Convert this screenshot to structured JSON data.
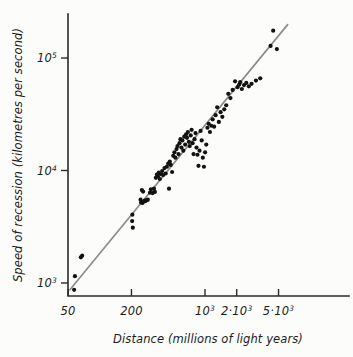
{
  "chart_data": {
    "type": "scatter",
    "title": "",
    "xlabel": "Distance (millions of light years)",
    "ylabel": "Speed of recession (kilometres per second)",
    "xscale": "log",
    "yscale": "log",
    "xlim": [
      45,
      7000
    ],
    "ylim": [
      750,
      250000
    ],
    "grid": false,
    "legend": null,
    "xticks": [
      {
        "value": 50,
        "label": "50",
        "mantissa": "50",
        "exponent": ""
      },
      {
        "value": 200,
        "label": "200",
        "mantissa": "200",
        "exponent": ""
      },
      {
        "value": 1000,
        "label": "10³",
        "mantissa": "10",
        "exponent": "3"
      },
      {
        "value": 2000,
        "label": "2·10³",
        "mantissa": "2·10",
        "exponent": "3"
      },
      {
        "value": 5000,
        "label": "5·10³",
        "mantissa": "5·10",
        "exponent": "3"
      }
    ],
    "yticks": [
      {
        "value": 1000,
        "label": "10³",
        "mantissa": "10",
        "exponent": "3"
      },
      {
        "value": 10000,
        "label": "10⁴",
        "mantissa": "10",
        "exponent": "4"
      },
      {
        "value": 100000,
        "label": "10⁵",
        "mantissa": "10",
        "exponent": "5"
      }
    ],
    "series": [
      {
        "name": "galaxies",
        "marker": "filled-circle",
        "marker_color": "#121212",
        "marker_size": 4.2,
        "points": [
          [
            57,
            870
          ],
          [
            58,
            1150
          ],
          [
            66,
            1690
          ],
          [
            68,
            1750
          ],
          [
            203,
            3550
          ],
          [
            204,
            4050
          ],
          [
            206,
            3100
          ],
          [
            244,
            5500
          ],
          [
            247,
            5200
          ],
          [
            251,
            6700
          ],
          [
            255,
            5150
          ],
          [
            258,
            6500
          ],
          [
            262,
            5300
          ],
          [
            268,
            5400
          ],
          [
            272,
            5350
          ],
          [
            279,
            5450
          ],
          [
            286,
            5500
          ],
          [
            300,
            6350
          ],
          [
            306,
            6800
          ],
          [
            318,
            6300
          ],
          [
            327,
            6900
          ],
          [
            334,
            6450
          ],
          [
            341,
            8600
          ],
          [
            349,
            9200
          ],
          [
            357,
            8900
          ],
          [
            364,
            9600
          ],
          [
            372,
            8400
          ],
          [
            381,
            9300
          ],
          [
            392,
            9900
          ],
          [
            400,
            9100
          ],
          [
            412,
            10500
          ],
          [
            423,
            9400
          ],
          [
            434,
            10800
          ],
          [
            447,
            11500
          ],
          [
            455,
            6900
          ],
          [
            463,
            12000
          ],
          [
            472,
            11200
          ],
          [
            487,
            9700
          ],
          [
            499,
            13500
          ],
          [
            512,
            14500
          ],
          [
            523,
            13000
          ],
          [
            536,
            15500
          ],
          [
            548,
            16500
          ],
          [
            560,
            14000
          ],
          [
            572,
            17500
          ],
          [
            584,
            19000
          ],
          [
            597,
            16000
          ],
          [
            610,
            18500
          ],
          [
            622,
            15000
          ],
          [
            635,
            20000
          ],
          [
            648,
            17000
          ],
          [
            661,
            21000
          ],
          [
            675,
            19500
          ],
          [
            688,
            22000
          ],
          [
            702,
            18000
          ],
          [
            716,
            16500
          ],
          [
            731,
            20500
          ],
          [
            746,
            23000
          ],
          [
            762,
            17500
          ],
          [
            778,
            14000
          ],
          [
            795,
            19000
          ],
          [
            812,
            21500
          ],
          [
            830,
            16000
          ],
          [
            848,
            13800
          ],
          [
            867,
            11000
          ],
          [
            887,
            15000
          ],
          [
            908,
            22500
          ],
          [
            930,
            18500
          ],
          [
            953,
            13000
          ],
          [
            977,
            10800
          ],
          [
            1002,
            14500
          ],
          [
            1028,
            17000
          ],
          [
            1055,
            24000
          ],
          [
            1084,
            26000
          ],
          [
            1115,
            22000
          ],
          [
            1148,
            25000
          ],
          [
            1183,
            28500
          ],
          [
            1221,
            24500
          ],
          [
            1262,
            31000
          ],
          [
            1306,
            36500
          ],
          [
            1354,
            27000
          ],
          [
            1406,
            33000
          ],
          [
            1462,
            30000
          ],
          [
            1524,
            35000
          ],
          [
            1591,
            38000
          ],
          [
            1664,
            48000
          ],
          [
            1745,
            44000
          ],
          [
            1834,
            52000
          ],
          [
            1932,
            62000
          ],
          [
            2040,
            55000
          ],
          [
            2116,
            58000
          ],
          [
            2160,
            61000
          ],
          [
            2240,
            53000
          ],
          [
            2350,
            57500
          ],
          [
            2470,
            60000
          ],
          [
            2610,
            56000
          ],
          [
            2770,
            59000
          ],
          [
            3050,
            63000
          ],
          [
            3350,
            66000
          ],
          [
            4200,
            128000
          ],
          [
            4450,
            175000
          ],
          [
            4820,
            120000
          ]
        ]
      }
    ],
    "trend_line": {
      "name": "Hubble law fit",
      "color": "#8d8d8d",
      "x_start": 52,
      "y_start": 870,
      "x_end": 6100,
      "y_end": 198000
    },
    "annotations": []
  }
}
